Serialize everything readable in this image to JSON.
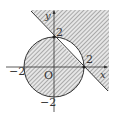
{
  "diagram": {
    "axes": {
      "x_label": "x",
      "y_label": "y",
      "origin_label": "O"
    },
    "ticks": {
      "x_pos": "2",
      "x_neg": "−2",
      "y_pos": "2",
      "y_neg": "−2"
    },
    "circle": {
      "center": [
        0,
        0
      ],
      "radius": 2
    },
    "line": {
      "equation": "x + y = 2",
      "intersections": [
        [
          0,
          2
        ],
        [
          2,
          0
        ]
      ]
    },
    "colors": {
      "stroke": "#333333",
      "hatch": "#555555",
      "background": "#ffffff"
    }
  }
}
